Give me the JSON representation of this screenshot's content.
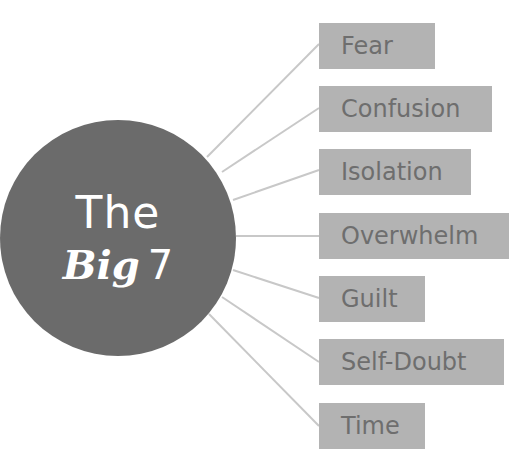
{
  "hub": {
    "line1": "The",
    "line2_bold": "Big",
    "line2_number": "7"
  },
  "colors": {
    "circle": "#6b6b6b",
    "box": "#b3b3b3",
    "box_text": "#6e6e6e",
    "connector": "#c8c8c8",
    "hub_text": "#ffffff"
  },
  "items": [
    {
      "label": "Fear",
      "top": 23,
      "width": 116
    },
    {
      "label": "Confusion",
      "top": 86,
      "width": 173
    },
    {
      "label": "Isolation",
      "top": 149,
      "width": 152
    },
    {
      "label": "Overwhelm",
      "top": 213,
      "width": 190
    },
    {
      "label": "Guilt",
      "top": 276,
      "width": 106
    },
    {
      "label": "Self-Doubt",
      "top": 339,
      "width": 185
    },
    {
      "label": "Time",
      "top": 403,
      "width": 106
    }
  ],
  "connectors": [
    {
      "x1": 207,
      "y1": 157,
      "x2": 319,
      "y2": 44
    },
    {
      "x1": 222,
      "y1": 172,
      "x2": 319,
      "y2": 108
    },
    {
      "x1": 233,
      "y1": 200,
      "x2": 319,
      "y2": 170
    },
    {
      "x1": 236,
      "y1": 236,
      "x2": 319,
      "y2": 236
    },
    {
      "x1": 233,
      "y1": 270,
      "x2": 319,
      "y2": 298
    },
    {
      "x1": 222,
      "y1": 297,
      "x2": 319,
      "y2": 362
    },
    {
      "x1": 209,
      "y1": 314,
      "x2": 319,
      "y2": 426
    }
  ]
}
